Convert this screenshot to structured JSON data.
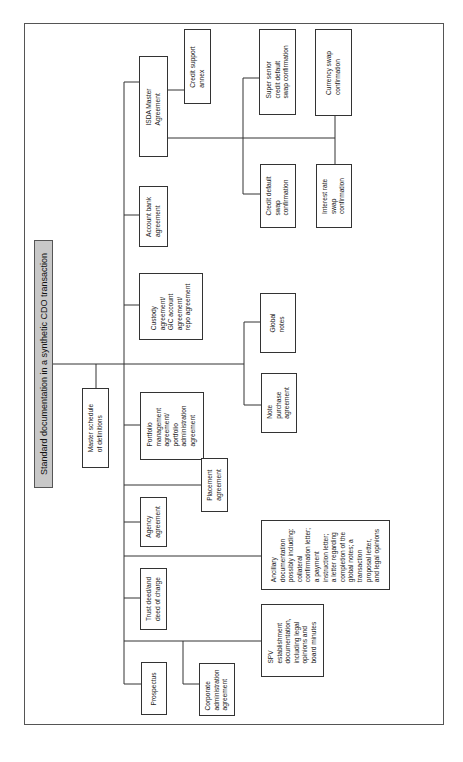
{
  "title": "Standard documentation in a synthetic CDO transaction",
  "nodes": {
    "master_schedule": [
      "Master schedule",
      "of definitions"
    ],
    "isda": [
      "ISDA Master",
      "Agreement"
    ],
    "credit_support": [
      "Credit support",
      "annex"
    ],
    "super_senior": [
      "Super senior",
      "credit default",
      "swap confirmation"
    ],
    "currency_swap": [
      "Currency swap",
      "confirmation"
    ],
    "credit_default": [
      "Credit default",
      "swap",
      "confirmation"
    ],
    "interest_rate": [
      "Interest rate",
      "swap",
      "confirmation"
    ],
    "account_bank": [
      "Account bank",
      "agreement"
    ],
    "custody": [
      "Custody",
      "agreement/",
      "GIC account",
      "agreement/",
      "repo agreement"
    ],
    "global_notes": [
      "Global",
      "notes"
    ],
    "note_purchase": [
      "Note",
      "purchase",
      "agreement"
    ],
    "portfolio": [
      "Portfolio",
      "management",
      "agreement/",
      "portfolio",
      "administration",
      "agreement"
    ],
    "placement": [
      "Placement",
      "agreement"
    ],
    "agency": [
      "Agency",
      "agreement"
    ],
    "ancillary": [
      "Ancillary",
      "documentation",
      "possibly including:",
      "collateral",
      "confirmation letter;",
      "a payment",
      "instruction letter;",
      "a letter regarding",
      "completion of the",
      "global notes; a",
      "transaction",
      "proposal letter,",
      "and legal opinions"
    ],
    "trust_deed": [
      "Trust deed/and",
      "deed of charge"
    ],
    "spv": [
      "SPV",
      "establishment",
      "documentation,",
      "including legal",
      "opinions and",
      "board minutes"
    ],
    "prospectus": [
      "Prospectus"
    ],
    "corporate_admin": [
      "Corporate",
      "administration",
      "agreement"
    ]
  }
}
